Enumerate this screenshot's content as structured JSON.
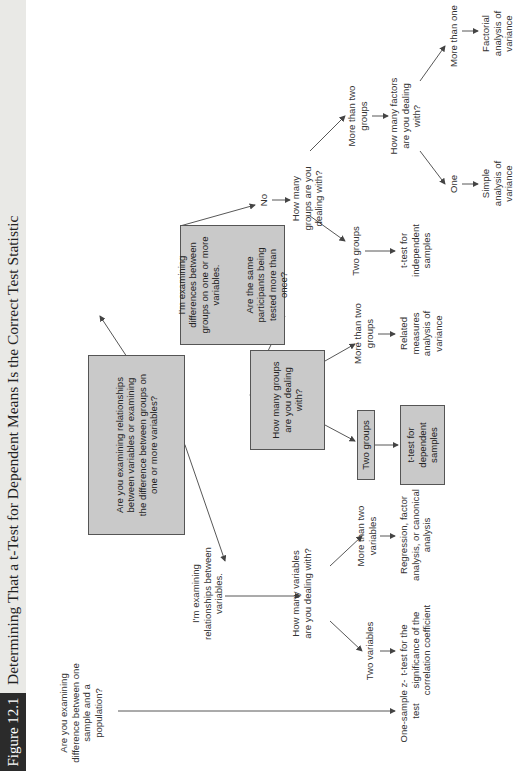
{
  "figure": {
    "label": "Figure 12.1",
    "title": "Determining That a t-Test for Dependent Means Is the Correct Test Statistic"
  },
  "colors": {
    "title_bar_bg": "#e9e9e6",
    "label_bg": "#2b2b2b",
    "box_fill": "#c9c9c9",
    "line": "#444444"
  },
  "nodes": {
    "q_one_sample": "Are you examining difference between one sample and a population?",
    "r_one_sample_z": "One-sample z-test",
    "q_root": "Are you examining relationships between variables or examining the difference between groups on one or more variables?",
    "a_relationships": "I'm examining relationships between variables.",
    "q_how_many_variables": "How many variables are you dealing with?",
    "a_two_variables": "Two variables",
    "r_t_correlation": "t-test for the significance of the correlation coefficient",
    "a_more_than_two_variables": "More than two variables",
    "r_regression": "Regression, factor analysis, or canonical analysis",
    "a_differences_box_line1": "I'm examining differences between groups on one or more variables.",
    "a_differences_box_line2": "Are the same participants being tested more than once?",
    "a_yes": "Yes",
    "q_how_many_groups_dep": "How many groups are you dealing with?",
    "a_two_groups_dep": "Two groups",
    "r_t_dependent": "t-test for dependent samples",
    "a_more_than_two_groups_dep": "More than two groups",
    "r_related_anova": "Related measures analysis of variance",
    "a_no": "No",
    "q_how_many_groups_ind": "How many groups are you dealing with?",
    "a_two_groups_ind": "Two groups",
    "r_t_independent": "t-test for independent samples",
    "a_more_than_two_groups_ind": "More than two groups",
    "q_how_many_factors": "How many factors are you dealing with?",
    "a_one_factor": "One",
    "r_simple_anova": "Simple analysis of variance",
    "a_more_than_one_factor": "More than one",
    "r_factorial_anova": "Factorial analysis of variance"
  }
}
